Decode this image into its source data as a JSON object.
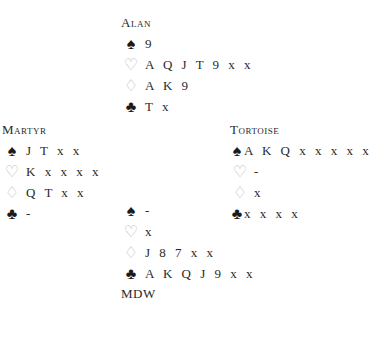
{
  "north": {
    "name": "Alan",
    "spades": "9",
    "hearts": "A Q J T 9 x x",
    "diamonds": "A K 9",
    "clubs": "T x"
  },
  "west": {
    "name": "Martyr",
    "spades": "J T x x",
    "hearts": "K x x x x",
    "diamonds": "Q T x x",
    "clubs": "-"
  },
  "east": {
    "name": "Tortoise",
    "spades": "A K Q x x x x x",
    "hearts": "-",
    "diamonds": "x",
    "clubs": "x x x x"
  },
  "south": {
    "name": "MDW",
    "spades": "-",
    "hearts": "x",
    "diamonds": "J 8 7 x x",
    "clubs": "A K Q J 9 x x"
  },
  "icons": {
    "spade": "♠",
    "heart": "♡",
    "diamond": "♢",
    "club": "♣"
  }
}
